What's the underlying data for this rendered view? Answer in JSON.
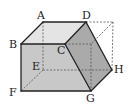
{
  "figure": {
    "type": "solid-geometry",
    "colors": {
      "face_front": "#c8c8c8",
      "face_top": "#e4e4e4",
      "face_cut": "#aaaaaa",
      "edge": "#222222",
      "hidden_edge": "#555555"
    },
    "vertices": [
      {
        "id": "A",
        "label": "A"
      },
      {
        "id": "B",
        "label": "B"
      },
      {
        "id": "C",
        "label": "C"
      },
      {
        "id": "D",
        "label": "D"
      },
      {
        "id": "E",
        "label": "E"
      },
      {
        "id": "F",
        "label": "F"
      },
      {
        "id": "G",
        "label": "G"
      },
      {
        "id": "H",
        "label": "H"
      }
    ]
  }
}
